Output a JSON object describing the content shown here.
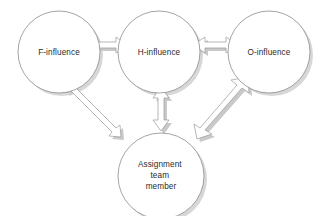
{
  "diagram": {
    "background_color": "#ffffff",
    "node_fill_color": "#ffffff",
    "node_stroke_color": "#8d8d8d",
    "shadow_color": "#c9c9c9",
    "arrow_fill_color": "#ffffff",
    "arrow_stroke_color": "#9a9a9a",
    "label_color": "#2b2b2b",
    "nodes": [
      {
        "id": "f-influence",
        "label": "F-influence",
        "lines": [
          "F-influence"
        ],
        "cx": 59,
        "cy": 52,
        "r": 41
      },
      {
        "id": "h-influence",
        "label": "H-influence",
        "lines": [
          "H-influence"
        ],
        "cx": 159,
        "cy": 52,
        "r": 41
      },
      {
        "id": "o-influence",
        "label": "O-influence",
        "lines": [
          "O-influence"
        ],
        "cx": 269,
        "cy": 52,
        "r": 41
      },
      {
        "id": "assignment-team-member",
        "label": "Assignment team member",
        "lines": [
          "Assignment",
          "team",
          "member"
        ],
        "cx": 161,
        "cy": 176,
        "r": 43
      }
    ],
    "connectors": [
      {
        "id": "f-h-connector",
        "from": "f-influence",
        "to": "h-influence",
        "style": "double-headed-block-arrow",
        "orientation": "horizontal",
        "weight": "medium"
      },
      {
        "id": "h-o-connector",
        "from": "h-influence",
        "to": "o-influence",
        "style": "double-headed-block-arrow",
        "orientation": "horizontal",
        "weight": "medium"
      },
      {
        "id": "h-assignment-connector",
        "from": "h-influence",
        "to": "assignment-team-member",
        "style": "double-headed-block-arrow",
        "orientation": "vertical",
        "weight": "medium"
      },
      {
        "id": "f-assignment-connector",
        "from": "f-influence",
        "to": "assignment-team-member",
        "style": "double-headed-block-arrow",
        "orientation": "diagonal",
        "weight": "thin"
      },
      {
        "id": "o-assignment-connector",
        "from": "o-influence",
        "to": "assignment-team-member",
        "style": "double-headed-block-arrow",
        "orientation": "diagonal",
        "weight": "thick"
      }
    ]
  }
}
